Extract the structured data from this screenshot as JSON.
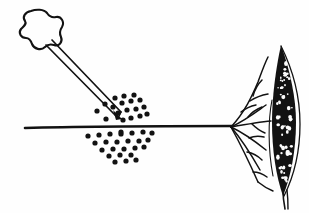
{
  "figure": {
    "title": "Injection into branching structure with stippled lens-shaped body",
    "background_color": "#fefefe",
    "ink_color": "#121212",
    "width": 309,
    "height": 213
  },
  "elements": {
    "syringe": {
      "name": "syringe-needle",
      "handle_label": "syringe-plunger-handle",
      "shaft_label": "needle-shaft",
      "tip_label": "needle-tip",
      "handle_center": [
        38,
        28
      ],
      "tip_point": [
        118,
        118
      ]
    },
    "surface_line": {
      "name": "horizontal-surface-line",
      "start": [
        25,
        128
      ],
      "end": [
        232,
        126
      ],
      "thickness": 2.6
    },
    "particle_cloud": {
      "name": "dispersed-particles",
      "count": 44,
      "dot_radius": 2.6,
      "color": "#121212"
    },
    "branch_network": {
      "name": "branching-root-network",
      "origin": [
        231,
        127
      ],
      "branch_count": 8
    },
    "lens_body": {
      "name": "stippled-lens-body",
      "center": [
        284,
        120
      ],
      "half_width": 11,
      "top": 45,
      "bottom": 196,
      "fill": "#121212",
      "speckle_count": 62
    },
    "outline_arc": {
      "name": "lens-outline-arc"
    },
    "stem_tail": {
      "name": "lower-stem-tail",
      "start": [
        283,
        190
      ],
      "end": [
        285,
        209
      ]
    }
  },
  "chart_data": {
    "type": "scatter",
    "xlabel": "",
    "ylabel": "",
    "xlim": [
      80,
      160
    ],
    "ylim": [
      90,
      168
    ],
    "grid": false,
    "legend": "none",
    "particles_above_line": [
      [
        115,
        98
      ],
      [
        124,
        96
      ],
      [
        134,
        95
      ],
      [
        105,
        104
      ],
      [
        113,
        107
      ],
      [
        122,
        103
      ],
      [
        131,
        101
      ],
      [
        140,
        100
      ],
      [
        97,
        111
      ],
      [
        118,
        113
      ],
      [
        127,
        110
      ],
      [
        136,
        109
      ],
      [
        144,
        107
      ],
      [
        131,
        118
      ],
      [
        140,
        116
      ],
      [
        147,
        114
      ],
      [
        106,
        119
      ],
      [
        123,
        120
      ]
    ],
    "particles_below_line": [
      [
        88,
        136
      ],
      [
        99,
        135
      ],
      [
        110,
        134
      ],
      [
        121,
        134
      ],
      [
        132,
        133
      ],
      [
        143,
        132
      ],
      [
        152,
        133
      ],
      [
        95,
        143
      ],
      [
        106,
        142
      ],
      [
        117,
        142
      ],
      [
        128,
        141
      ],
      [
        139,
        141
      ],
      [
        148,
        140
      ],
      [
        102,
        150
      ],
      [
        113,
        149
      ],
      [
        124,
        149
      ],
      [
        135,
        148
      ],
      [
        144,
        147
      ],
      [
        109,
        156
      ],
      [
        120,
        155
      ],
      [
        131,
        155
      ],
      [
        115,
        162
      ],
      [
        126,
        161
      ],
      [
        136,
        160
      ],
      [
        121,
        132
      ]
    ]
  }
}
